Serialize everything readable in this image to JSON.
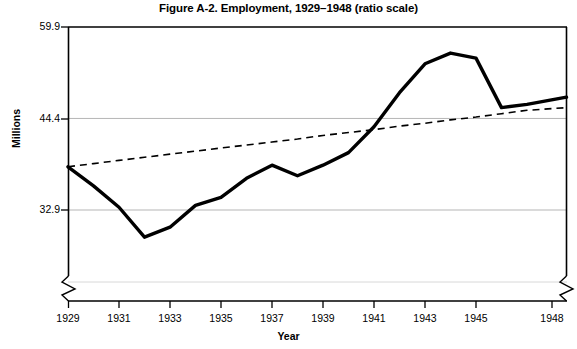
{
  "chart_data": {
    "type": "line",
    "title": "Figure A-2. Employment, 1929–1948 (ratio scale)",
    "subtitle": "",
    "xlabel": "Year",
    "ylabel": "Millions",
    "scale": "ratio (logarithmic) y-axis",
    "grid": "horizontal gridlines at labeled y ticks",
    "legend": "none",
    "axis_breaks": {
      "y_axis_break_below": 32.9,
      "x_axis_break_before": 1948,
      "note": "zigzag break marks on both the lower left y-axis and the right end of the x-axis"
    },
    "ylim": [
      27.5,
      59.9
    ],
    "yticks": [
      32.9,
      44.4,
      59.9
    ],
    "ytick_labels": [
      "32.9",
      "44.4",
      "59.9"
    ],
    "xlim": [
      1929,
      1948
    ],
    "xticks": [
      1929,
      1931,
      1933,
      1935,
      1937,
      1939,
      1941,
      1943,
      1945,
      1948
    ],
    "xtick_labels": [
      "1929",
      "1931",
      "1933",
      "1935",
      "1937",
      "1939",
      "1941",
      "1943",
      "1945",
      "1948"
    ],
    "x": [
      1929,
      1930,
      1931,
      1932,
      1933,
      1934,
      1935,
      1936,
      1937,
      1938,
      1939,
      1940,
      1941,
      1942,
      1943,
      1944,
      1945,
      1946,
      1947,
      1948
    ],
    "series": [
      {
        "name": "Employment",
        "style": "solid",
        "color": "#000000",
        "values": [
          37.9,
          35.6,
          33.2,
          30.1,
          31.1,
          33.4,
          34.3,
          36.5,
          38.1,
          36.8,
          38.1,
          39.7,
          43.2,
          48.3,
          53.1,
          55.0,
          54.1,
          46.0,
          46.5,
          47.6
        ]
      },
      {
        "name": "Trend",
        "style": "dashed",
        "color": "#000000",
        "values": [
          37.9,
          38.3,
          38.7,
          39.1,
          39.5,
          39.9,
          40.3,
          40.7,
          41.1,
          41.5,
          42.0,
          42.4,
          42.8,
          43.3,
          43.7,
          44.2,
          44.6,
          45.1,
          45.6,
          46.0
        ]
      }
    ],
    "annotations": []
  },
  "colors": {
    "frame": "#000000",
    "gridline": "#b5b5b5",
    "data_line": "#000000",
    "trend_line": "#000000",
    "background": "#ffffff"
  }
}
